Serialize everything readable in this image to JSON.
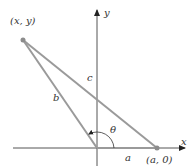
{
  "diagram": {
    "type": "law-of-cosines-triangle",
    "colors": {
      "axis": "#555555",
      "side": "#9a9a9a",
      "point": "#8c8c8c",
      "text": "#333333",
      "arrow": "#222222"
    },
    "points": {
      "xy": {
        "label": "(x, y)",
        "px": 23,
        "py": 40
      },
      "origin": {
        "px": 97,
        "py": 148
      },
      "a0": {
        "label": "(a, 0)",
        "px": 157,
        "py": 148
      }
    },
    "axes": {
      "x_label": "x",
      "y_label": "y"
    },
    "sides": {
      "a": "a",
      "b": "b",
      "c": "c"
    },
    "angle": {
      "label": "θ"
    }
  }
}
